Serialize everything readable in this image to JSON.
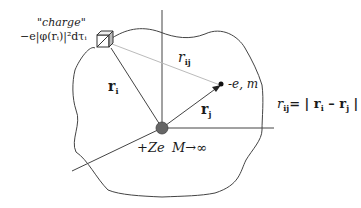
{
  "diagram": {
    "type": "atomic-coordinates",
    "labels": {
      "charge_title": "\"charge\"",
      "charge_expr": "−e|φ(rᵢ)|²dτᵢ",
      "r_i": "r",
      "r_i_sub": "i",
      "r_j": "r",
      "r_j_sub": "j",
      "r_ij": "r",
      "r_ij_sub": "ij",
      "electron": "-e, m",
      "nucleus": "+Ze",
      "mass_limit": "M→∞",
      "formula_lhs": "r",
      "formula_lhs_sub": "ij",
      "formula_eq": "= | ",
      "formula_ri": "r",
      "formula_ri_sub": "i",
      "formula_minus": " – ",
      "formula_rj": "r",
      "formula_rj_sub": "j",
      "formula_end": " |"
    },
    "colors": {
      "line": "#444444",
      "light_line": "#bbbbbb",
      "nucleus": "#666666"
    }
  }
}
